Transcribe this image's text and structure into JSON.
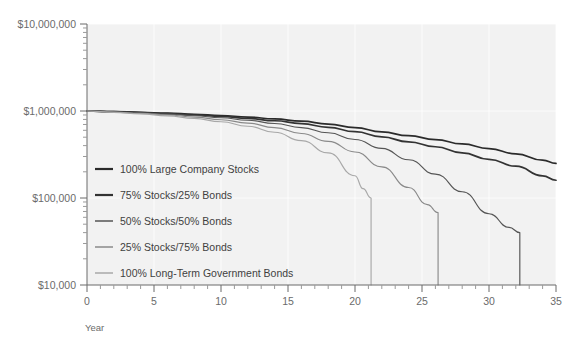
{
  "chart_data": {
    "type": "line",
    "title": "",
    "xlabel": "Year",
    "ylabel": "",
    "xlim": [
      0,
      35
    ],
    "ylim": [
      10000,
      10000000
    ],
    "yscale": "log",
    "grid": true,
    "legend_position": "inside-left",
    "x_ticks": [
      0,
      5,
      10,
      15,
      20,
      25,
      30,
      35
    ],
    "x_tick_labels": [
      "0",
      "5",
      "10",
      "15",
      "20",
      "25",
      "30",
      "35"
    ],
    "x_minor_step": 1,
    "y_ticks": [
      10000,
      100000,
      1000000,
      10000000
    ],
    "y_tick_labels": [
      "$10,000",
      "$100,000",
      "$1,000,000",
      "$10,000,000"
    ],
    "start_value": 1000000,
    "series": [
      {
        "name": "100% Large Company Stocks",
        "color": "#2b2b2b",
        "depletion_year": null,
        "end_value": 250000,
        "x": [
          0,
          2,
          4,
          6,
          8,
          10,
          12,
          14,
          16,
          18,
          20,
          22,
          24,
          26,
          28,
          30,
          32,
          34,
          35
        ],
        "values": [
          1000000,
          985000,
          966000,
          944000,
          918000,
          888000,
          852000,
          811000,
          763000,
          708000,
          645000,
          575000,
          520000,
          470000,
          418000,
          370000,
          322000,
          272000,
          250000
        ]
      },
      {
        "name": "75% Stocks/25% Bonds",
        "color": "#333333",
        "depletion_year": null,
        "end_value": 160000,
        "x": [
          0,
          2,
          4,
          6,
          8,
          10,
          12,
          14,
          16,
          18,
          20,
          22,
          24,
          26,
          28,
          30,
          32,
          34,
          35
        ],
        "values": [
          1000000,
          982000,
          960000,
          934000,
          903000,
          866000,
          823000,
          773000,
          715000,
          650000,
          578000,
          505000,
          442000,
          388000,
          330000,
          278000,
          232000,
          180000,
          160000
        ]
      },
      {
        "name": "50% Stocks/50% Bonds",
        "color": "#555555",
        "depletion_year": 32.3,
        "end_value": 10000,
        "x": [
          0,
          2,
          4,
          6,
          8,
          10,
          12,
          14,
          16,
          18,
          20,
          22,
          24,
          26,
          28,
          30,
          31.5,
          32.3
        ],
        "values": [
          1000000,
          978000,
          952000,
          920000,
          882000,
          836000,
          782000,
          718000,
          645000,
          562000,
          470000,
          372000,
          275000,
          188000,
          118000,
          66000,
          46000,
          40000
        ]
      },
      {
        "name": "25% Stocks/75% Bonds",
        "color": "#8a8a8a",
        "depletion_year": 26.2,
        "end_value": 10000,
        "x": [
          0,
          2,
          4,
          6,
          8,
          10,
          12,
          14,
          16,
          18,
          20,
          22,
          24,
          25.4,
          26.2
        ],
        "values": [
          1000000,
          972000,
          940000,
          900000,
          852000,
          794000,
          726000,
          645000,
          552000,
          448000,
          338000,
          228000,
          132000,
          84000,
          68000
        ]
      },
      {
        "name": "100% Long-Term Government Bonds",
        "color": "#a8a8a8",
        "depletion_year": 21.2,
        "end_value": 10000,
        "x": [
          0,
          2,
          4,
          6,
          8,
          10,
          12,
          14,
          16,
          18,
          20,
          20.6,
          21.2
        ],
        "values": [
          1000000,
          966000,
          928000,
          880000,
          822000,
          752000,
          668000,
          570000,
          456000,
          330000,
          180000,
          128000,
          100000
        ]
      }
    ]
  },
  "legend": {
    "entries": [
      {
        "label": "100% Large Company Stocks",
        "color": "#2b2b2b"
      },
      {
        "label": "75% Stocks/25% Bonds",
        "color": "#333333"
      },
      {
        "label": "50% Stocks/50% Bonds",
        "color": "#555555"
      },
      {
        "label": "25% Stocks/75% Bonds",
        "color": "#8a8a8a"
      },
      {
        "label": "100% Long-Term Government Bonds",
        "color": "#a8a8a8"
      }
    ]
  },
  "axes": {
    "x_title": "Year",
    "y_labels": [
      "$10,000,000",
      "$1,000,000",
      "$100,000",
      "$10,000"
    ],
    "x_labels": [
      "0",
      "5",
      "10",
      "15",
      "20",
      "25",
      "30",
      "35"
    ]
  },
  "style": {
    "plot_background": "#f2f2f2",
    "axis_color": "#6b6b6b",
    "grid_color": "#ffffff",
    "tick_label_color": "#6b6b6b"
  }
}
